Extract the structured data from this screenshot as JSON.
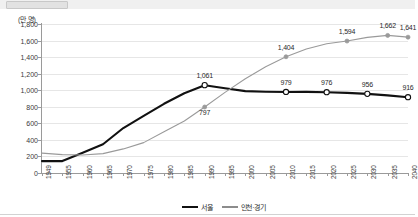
{
  "topbar": {
    "present": true
  },
  "chart_data": {
    "type": "line",
    "title": "",
    "subtitle": "",
    "unit_label": "(만 명)",
    "xlabel": "",
    "ylabel": "",
    "ylim": [
      0,
      1800
    ],
    "ytick_step": 200,
    "yticks": [
      "0",
      "200",
      "400",
      "600",
      "800",
      "1,000",
      "1,200",
      "1,400",
      "1,600",
      "1,800"
    ],
    "grid": true,
    "legend_position": "bottom-center",
    "categories": [
      "1949",
      "1955",
      "1960",
      "1965",
      "1970",
      "1975",
      "1980",
      "1985",
      "1990",
      "1995",
      "2000",
      "2005",
      "2010",
      "2015",
      "2020",
      "2025",
      "2030",
      "2035",
      "2040"
    ],
    "series": [
      {
        "name": "서울",
        "color": "#111111",
        "values": [
          144,
          144,
          245,
          347,
          543,
          689,
          836,
          964,
          1061,
          1023,
          989,
          982,
          979,
          980,
          976,
          968,
          956,
          938,
          916
        ],
        "labels": [
          {
            "category": "1990",
            "value": 1061,
            "text": "1,061"
          },
          {
            "category": "2010",
            "value": 979,
            "text": "979"
          },
          {
            "category": "2020",
            "value": 976,
            "text": "976"
          },
          {
            "category": "2030",
            "value": 956,
            "text": "956"
          },
          {
            "category": "2040",
            "value": 916,
            "text": "916"
          }
        ],
        "markers": [
          "1990",
          "2010",
          "2020",
          "2030",
          "2040"
        ]
      },
      {
        "name": "인천·경기",
        "color": "#9a9a9a",
        "values": [
          240,
          222,
          218,
          234,
          291,
          367,
          498,
          628,
          797,
          974,
          1139,
          1283,
          1404,
          1498,
          1562,
          1594,
          1638,
          1662,
          1641
        ],
        "labels": [
          {
            "category": "1990",
            "value": 797,
            "text": "797"
          },
          {
            "category": "2010",
            "value": 1404,
            "text": "1,404"
          },
          {
            "category": "2025",
            "value": 1594,
            "text": "1,594"
          },
          {
            "category": "2035",
            "value": 1662,
            "text": "1,662"
          },
          {
            "category": "2040",
            "value": 1641,
            "text": "1,641"
          }
        ],
        "markers": [
          "1990",
          "2010",
          "2025",
          "2035",
          "2040"
        ]
      }
    ]
  },
  "legend": [
    {
      "label": "서울",
      "color": "#111111"
    },
    {
      "label": "인천·경기",
      "color": "#9a9a9a"
    }
  ]
}
